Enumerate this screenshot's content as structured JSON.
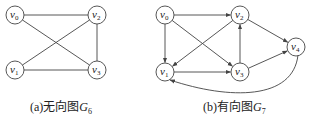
{
  "graphs": [
    {
      "id": "G6",
      "type": "undirected",
      "caption_prefix": "(a)",
      "caption_text": "无向图",
      "caption_symbol": "G",
      "caption_sub": "6",
      "nodes": [
        {
          "id": "v0",
          "label": "v",
          "sub": "0",
          "x": 15,
          "y": 15
        },
        {
          "id": "v2",
          "label": "v",
          "sub": "2",
          "x": 97,
          "y": 15
        },
        {
          "id": "v1",
          "label": "v",
          "sub": "1",
          "x": 15,
          "y": 70
        },
        {
          "id": "v3",
          "label": "v",
          "sub": "3",
          "x": 97,
          "y": 70
        }
      ],
      "edges": [
        [
          "v0",
          "v2"
        ],
        [
          "v0",
          "v3"
        ],
        [
          "v1",
          "v2"
        ],
        [
          "v1",
          "v3"
        ],
        [
          "v2",
          "v3"
        ]
      ]
    },
    {
      "id": "G7",
      "type": "directed",
      "caption_prefix": "(b)",
      "caption_text": "有向图",
      "caption_symbol": "G",
      "caption_sub": "7",
      "nodes": [
        {
          "id": "v0",
          "label": "v",
          "sub": "0",
          "x": 165,
          "y": 15
        },
        {
          "id": "v2",
          "label": "v",
          "sub": "2",
          "x": 240,
          "y": 15
        },
        {
          "id": "v4",
          "label": "v",
          "sub": "4",
          "x": 296,
          "y": 47
        },
        {
          "id": "v1",
          "label": "v",
          "sub": "1",
          "x": 165,
          "y": 72
        },
        {
          "id": "v3",
          "label": "v",
          "sub": "3",
          "x": 240,
          "y": 72
        }
      ],
      "edges": [
        [
          "v0",
          "v2"
        ],
        [
          "v0",
          "v1"
        ],
        [
          "v0",
          "v3"
        ],
        [
          "v2",
          "v1"
        ],
        [
          "v2",
          "v4"
        ],
        [
          "v3",
          "v2"
        ],
        [
          "v3",
          "v4"
        ],
        [
          "v1",
          "v3"
        ],
        [
          "v4",
          "v1"
        ]
      ]
    }
  ],
  "colors": {
    "stroke": "#444444",
    "text": "#222222",
    "background": "#ffffff"
  }
}
